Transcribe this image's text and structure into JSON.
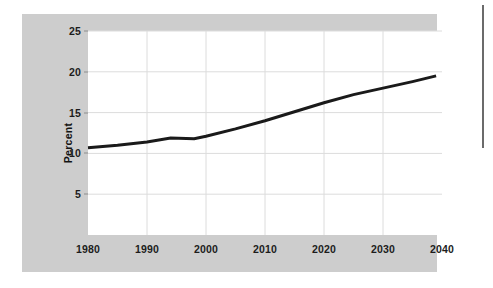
{
  "figure": {
    "panel_color": "#cdcdcd",
    "plot_background": "#ffffff",
    "page_background": "#ffffff",
    "rule_color": "#6b6b6b"
  },
  "axis": {
    "y_title": "Percent",
    "y_ticks": [
      "5",
      "10",
      "15",
      "20",
      "25"
    ],
    "x_ticks": [
      "1980",
      "1990",
      "2000",
      "2010",
      "2020",
      "2030",
      "2040"
    ]
  },
  "chart_data": {
    "type": "line",
    "title": "",
    "xlabel": "",
    "ylabel": "Percent",
    "xlim": [
      1980,
      2040
    ],
    "ylim": [
      0,
      25
    ],
    "grid": true,
    "legend": "none",
    "line_color": "#1a1a1a",
    "line_width": 3,
    "x_tick_values": [
      1980,
      1990,
      2000,
      2010,
      2020,
      2030,
      2040
    ],
    "y_tick_values": [
      5,
      10,
      15,
      20,
      25
    ],
    "series": [
      {
        "name": "Percent",
        "x": [
          1980,
          1985,
          1990,
          1994,
          1998,
          2000,
          2005,
          2010,
          2015,
          2020,
          2025,
          2030,
          2035,
          2039
        ],
        "values": [
          10.7,
          11.0,
          11.4,
          11.9,
          11.8,
          12.1,
          13.0,
          14.0,
          15.1,
          16.2,
          17.2,
          18.0,
          18.8,
          19.5
        ]
      }
    ]
  }
}
